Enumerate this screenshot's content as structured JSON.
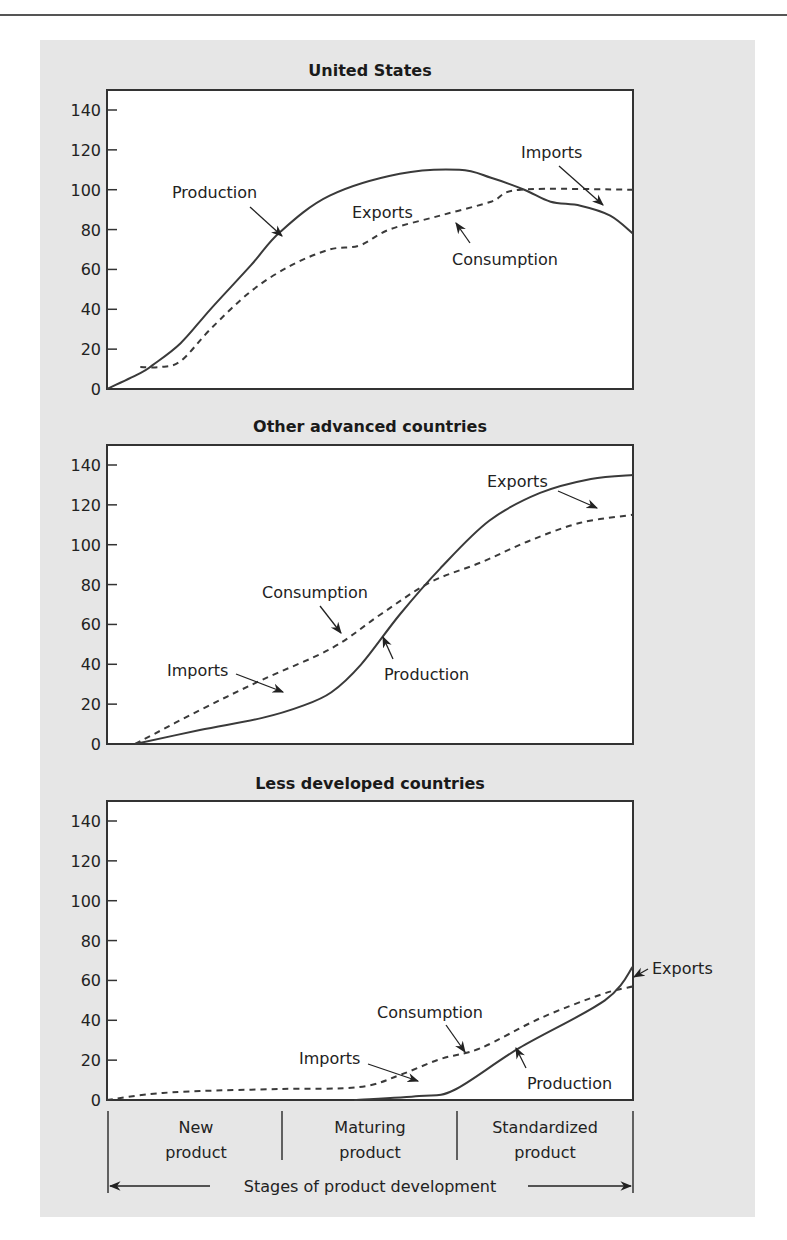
{
  "figure": {
    "stages_axis_label": "Stages of product development",
    "stages": [
      {
        "line1": "New",
        "line2": "product"
      },
      {
        "line1": "Maturing",
        "line2": "product"
      },
      {
        "line1": "Standardized",
        "line2": "product"
      }
    ],
    "colors": {
      "panel_background": "#e6e6e6",
      "plot_background": "#ffffff",
      "line": "#3a3a3a"
    }
  },
  "chart_data": [
    {
      "type": "line",
      "title": "United States",
      "xlabel": "Stages of product development",
      "ylabel": "",
      "ylim": [
        0,
        150
      ],
      "yticks": [
        0,
        20,
        40,
        60,
        80,
        100,
        120,
        140
      ],
      "x_categories": [
        "New product",
        "Maturing product",
        "Standardized product"
      ],
      "x_range": [
        0,
        3
      ],
      "series": [
        {
          "name": "Production",
          "style": "solid",
          "x": [
            0,
            0.19,
            0.26,
            0.42,
            0.59,
            0.82,
            0.99,
            1.27,
            1.67,
            2.01,
            2.19,
            2.38,
            2.53,
            2.7,
            2.87,
            3.0
          ],
          "values": [
            0,
            8,
            12,
            23,
            40,
            62,
            79,
            97,
            108,
            110,
            106,
            100,
            94,
            92,
            87,
            78
          ]
        },
        {
          "name": "Consumption",
          "style": "dashed",
          "x": [
            0.19,
            0.3,
            0.42,
            0.59,
            0.82,
            1.05,
            1.27,
            1.44,
            1.61,
            1.9,
            2.19,
            2.36,
            3.0
          ],
          "values": [
            11,
            11,
            14,
            30,
            49,
            62,
            70,
            72,
            80,
            87,
            94,
            100,
            100
          ]
        }
      ],
      "annotations": [
        {
          "text": "Production",
          "points_to": "Production"
        },
        {
          "text": "Exports",
          "region": "gap where Production exceeds Consumption"
        },
        {
          "text": "Consumption",
          "points_to": "Consumption"
        },
        {
          "text": "Imports",
          "region": "gap where Consumption exceeds Production"
        }
      ]
    },
    {
      "type": "line",
      "title": "Other advanced countries",
      "xlabel": "Stages of product development",
      "ylabel": "",
      "ylim": [
        0,
        150
      ],
      "yticks": [
        0,
        20,
        40,
        60,
        80,
        100,
        120,
        140
      ],
      "x_categories": [
        "New product",
        "Maturing product",
        "Standardized product"
      ],
      "x_range": [
        0,
        3
      ],
      "series": [
        {
          "name": "Production",
          "style": "solid",
          "x": [
            0.16,
            0.53,
            0.88,
            1.11,
            1.28,
            1.45,
            1.67,
            1.9,
            2.18,
            2.47,
            2.76,
            3.0
          ],
          "values": [
            0,
            7,
            13,
            19,
            26,
            40,
            65,
            88,
            112,
            126,
            133,
            135
          ]
        },
        {
          "name": "Consumption",
          "style": "dashed",
          "x": [
            0.16,
            0.53,
            0.88,
            1.28,
            1.56,
            1.84,
            2.13,
            2.41,
            2.7,
            3.0
          ],
          "values": [
            0,
            17,
            32,
            48,
            65,
            81,
            91,
            102,
            111,
            115
          ]
        }
      ],
      "annotations": [
        {
          "text": "Exports",
          "region": "gap where Production exceeds Consumption"
        },
        {
          "text": "Consumption",
          "points_to": "Consumption"
        },
        {
          "text": "Imports",
          "region": "gap where Consumption exceeds Production"
        },
        {
          "text": "Production",
          "points_to": "Production"
        }
      ]
    },
    {
      "type": "line",
      "title": "Less developed countries",
      "xlabel": "Stages of product development",
      "ylabel": "",
      "ylim": [
        0,
        150
      ],
      "yticks": [
        0,
        20,
        40,
        60,
        80,
        100,
        120,
        140
      ],
      "x_categories": [
        "New product",
        "Maturing product",
        "Standardized product"
      ],
      "x_range": [
        0,
        3
      ],
      "series": [
        {
          "name": "Production",
          "style": "solid",
          "x": [
            1.41,
            1.78,
            1.98,
            2.35,
            2.84,
            3.0
          ],
          "values": [
            0,
            2,
            5,
            26,
            50,
            67
          ]
        },
        {
          "name": "Consumption",
          "style": "dashed",
          "x": [
            0,
            0.25,
            0.53,
            0.99,
            1.44,
            1.67,
            1.9,
            2.13,
            2.47,
            2.82,
            3.0
          ],
          "values": [
            0,
            3,
            4.5,
            5.5,
            6.5,
            12.5,
            20.5,
            26,
            41,
            53,
            57
          ]
        }
      ],
      "annotations": [
        {
          "text": "Consumption",
          "points_to": "Consumption"
        },
        {
          "text": "Imports",
          "region": "gap where Consumption exceeds Production"
        },
        {
          "text": "Production",
          "points_to": "Production"
        },
        {
          "text": "Exports",
          "region": "gap where Production exceeds Consumption"
        }
      ]
    }
  ]
}
